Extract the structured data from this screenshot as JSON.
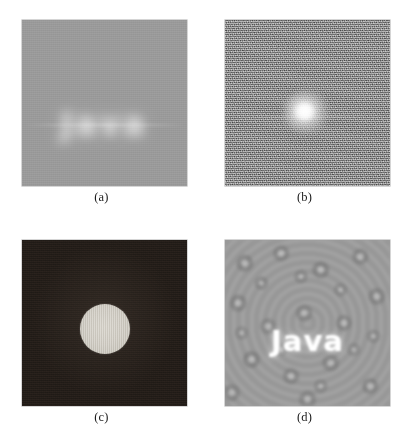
{
  "figure": {
    "panels": [
      {
        "key": "a",
        "caption": "(a)",
        "content_text": "Java",
        "description": "blurred spatial-domain image of the word Java on a flat gray field",
        "background_color": "#9b9b9b",
        "text_color": "#ffffff"
      },
      {
        "key": "b",
        "caption": "(b)",
        "content_text": "",
        "description": "Fourier magnitude spectrum: bright central blob on noisy gray field",
        "background_color": "#8d8d8d",
        "blob_color": "#ffffff"
      },
      {
        "key": "c",
        "caption": "(c)",
        "content_text": "",
        "description": "ideal low-pass filter mask: bright circular disk on a dark field",
        "background_color": "#2c2520",
        "disk_color": "#cfcbc2"
      },
      {
        "key": "d",
        "caption": "(d)",
        "content_text": "Java",
        "description": "filtered result: crisp white Java over a mottled ringing texture",
        "background_color": "#9d9d9d",
        "text_color": "#ffffff"
      }
    ]
  },
  "chart_data": {
    "type": "heatmap",
    "xlabel": "",
    "ylabel": "",
    "legend_position": "none",
    "grid": false,
    "panels": [
      {
        "label": "(a)",
        "type": "grayscale-image",
        "domain": "spatial",
        "background_gray_level": 155,
        "foreground_gray_level": 235,
        "foreground_text": "Java",
        "blur_radius_px": 5,
        "notes": "soft blurred glow of the word Java centered horizontally, slightly above vertical center"
      },
      {
        "label": "(b)",
        "type": "grayscale-image",
        "domain": "frequency",
        "background_gray_level": 141,
        "peak_gray_level": 255,
        "noise": "high",
        "blob_center_xy_fraction": [
          0.49,
          0.56
        ],
        "blob_radius_fraction": 0.14,
        "notes": "Fourier magnitude spectrum with DC peak as a bright blob"
      },
      {
        "label": "(c)",
        "type": "grayscale-image",
        "domain": "frequency",
        "background_gray_level": 44,
        "disk_gray_level": 203,
        "disk_center_xy_fraction": [
          0.5,
          0.54
        ],
        "disk_radius_fraction": 0.152,
        "notes": "ideal low-pass filter transfer function H(u,v): 1 inside the circle, 0 outside"
      },
      {
        "label": "(d)",
        "type": "grayscale-image",
        "domain": "spatial",
        "background_gray_level": 157,
        "foreground_gray_level": 252,
        "foreground_text": "Java",
        "blur_radius_px": 1,
        "notes": "inverse transform of the filtered spectrum showing ringing artifacts around recovered text"
      }
    ]
  }
}
